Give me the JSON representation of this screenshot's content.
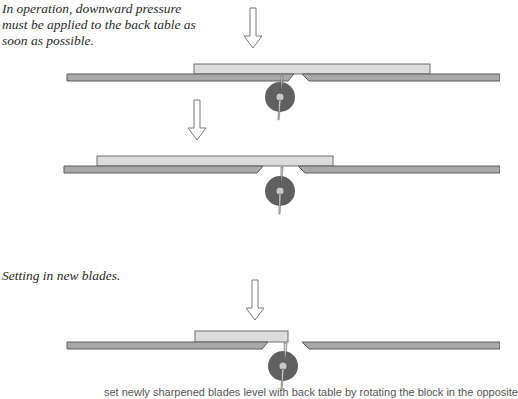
{
  "captions": {
    "operation": "In operation, downward pressure must be applied to the back table as soon as possible.",
    "setting": "Setting in new blades.",
    "footer_partial": "set newly sharpened blades level with back table by rotating the block in the opposite"
  },
  "colors": {
    "table_fill": "#a9a9a9",
    "table_stroke": "#5a5a5a",
    "board_fill": "#dcdcdc",
    "board_stroke": "#6e6e6e",
    "blade_disc": "#606060",
    "blade_hub": "#c8c8c8",
    "arrow_stroke": "#7a7a7a"
  },
  "diagrams": [
    {
      "name": "operation-step-1",
      "arrow": {
        "x": 253,
        "y1": 8,
        "y2": 48
      },
      "board": {
        "x1": 194,
        "x2": 430
      },
      "table_y": 74,
      "disc": {
        "cx": 280,
        "cy": 97
      }
    },
    {
      "name": "operation-step-2",
      "arrow": {
        "x": 197,
        "y1": 97,
        "y2": 144
      },
      "board": {
        "x1": 97,
        "x2": 333
      },
      "table_y": 166,
      "disc": {
        "cx": 280,
        "cy": 191
      }
    },
    {
      "name": "setting-new-blades",
      "arrow": {
        "x": 255,
        "y1": 275,
        "y2": 320
      },
      "board": {
        "x1": 195,
        "x2": 288
      },
      "table_y": 342,
      "disc": {
        "cx": 283,
        "cy": 366
      }
    }
  ]
}
